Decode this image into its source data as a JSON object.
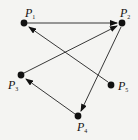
{
  "diagram": {
    "type": "directed-graph",
    "colors": {
      "background": "#f4f4f2",
      "ink": "#111111"
    },
    "nodes": [
      {
        "id": "P1",
        "label": "P",
        "sub": "1",
        "x": 24,
        "y": 23
      },
      {
        "id": "P2",
        "label": "P",
        "sub": "2",
        "x": 122,
        "y": 23
      },
      {
        "id": "P3",
        "label": "P",
        "sub": "3",
        "x": 21,
        "y": 75
      },
      {
        "id": "P4",
        "label": "P",
        "sub": "4",
        "x": 78,
        "y": 116
      },
      {
        "id": "P5",
        "label": "P",
        "sub": "5",
        "x": 111,
        "y": 85
      }
    ],
    "edges": [
      {
        "from": "P1",
        "to": "P2"
      },
      {
        "from": "P5",
        "to": "P1"
      },
      {
        "from": "P3",
        "to": "P2"
      },
      {
        "from": "P2",
        "to": "P4"
      },
      {
        "from": "P4",
        "to": "P3"
      }
    ]
  }
}
